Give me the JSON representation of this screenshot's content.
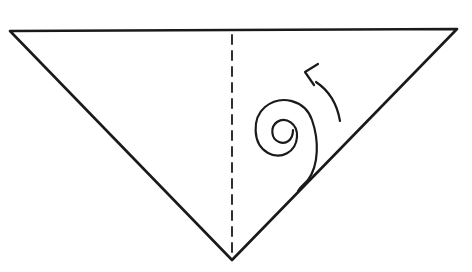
{
  "diagram": {
    "type": "origami-fold-instruction",
    "shape": "inverted-triangle",
    "colors": {
      "stroke": "#1a1a1a",
      "background": "#ffffff"
    },
    "triangle": {
      "points": [
        [
          10,
          31
        ],
        [
          457,
          29
        ],
        [
          232,
          260
        ]
      ]
    },
    "crease": {
      "style": "dashed",
      "x": 232,
      "y1": 34,
      "y2": 258
    },
    "spiral": {
      "description": "roll-from-corner spiral",
      "center": [
        272,
        150
      ]
    },
    "arrow": {
      "direction": "counter-clockwise",
      "meaning": "roll up"
    }
  }
}
